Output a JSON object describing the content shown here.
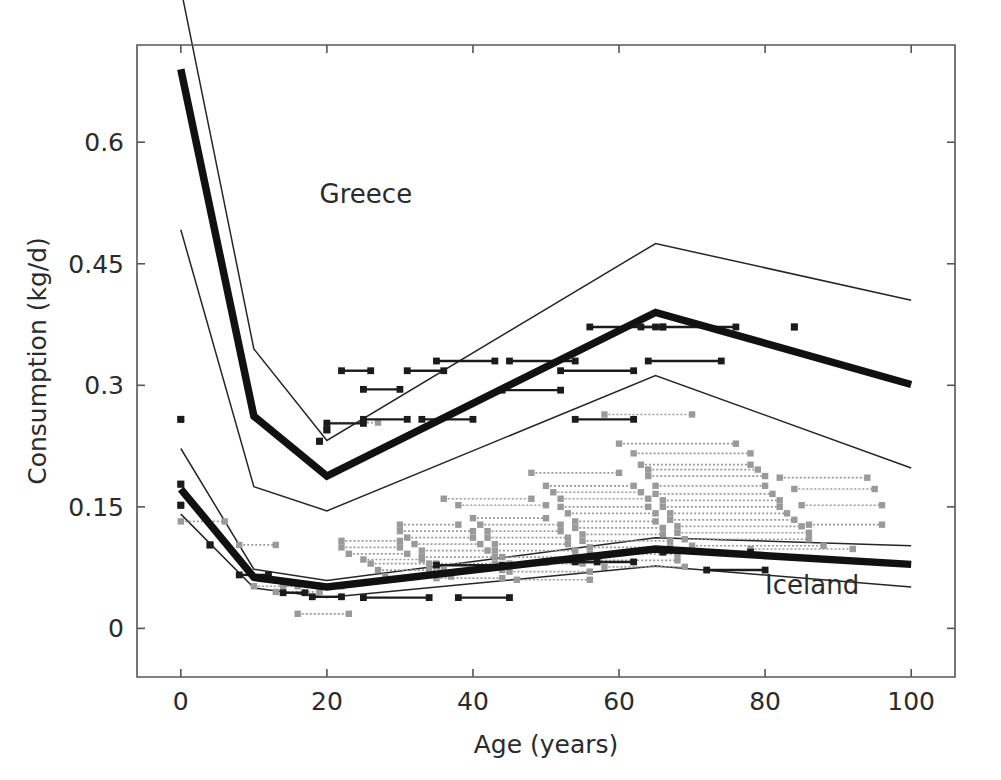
{
  "chart_data": {
    "type": "line",
    "title": "",
    "xlabel": "Age (years)",
    "ylabel": "Consumption (kg/d)",
    "xlim": [
      -6,
      106
    ],
    "ylim": [
      -0.06,
      0.72
    ],
    "xticks": [
      0,
      20,
      40,
      60,
      80,
      100
    ],
    "xticklabels": [
      "0",
      "20",
      "40",
      "60",
      "80",
      "100"
    ],
    "yticks": [
      0,
      0.15,
      0.3,
      0.45,
      0.6
    ],
    "yticklabels": [
      "0",
      "0.15",
      "0.3",
      "0.45",
      "0.6"
    ],
    "grid": false,
    "legend_position": "in-plot annotations",
    "annotations": [
      {
        "text": "Greece",
        "x": 19,
        "y": 0.525
      },
      {
        "text": "Iceland",
        "x": 80,
        "y": 0.042
      }
    ],
    "x": [
      0,
      10,
      20,
      65,
      100
    ],
    "series": [
      {
        "name": "Greece upper band",
        "style": "thin-line",
        "color": "#262626",
        "x": [
          0,
          10,
          20,
          65,
          100
        ],
        "values": [
          0.79,
          0.345,
          0.232,
          0.475,
          0.405
        ]
      },
      {
        "name": "Greece median",
        "style": "thick-line",
        "color": "#111111",
        "x": [
          0,
          10,
          20,
          65,
          100
        ],
        "values": [
          0.69,
          0.262,
          0.188,
          0.39,
          0.301
        ]
      },
      {
        "name": "Greece lower band",
        "style": "thin-line",
        "color": "#262626",
        "x": [
          0,
          10,
          20,
          65,
          100
        ],
        "values": [
          0.492,
          0.175,
          0.145,
          0.312,
          0.198
        ]
      },
      {
        "name": "Iceland upper band",
        "style": "thin-line",
        "color": "#262626",
        "x": [
          0,
          10,
          20,
          65,
          100
        ],
        "values": [
          0.222,
          0.073,
          0.059,
          0.112,
          0.102
        ]
      },
      {
        "name": "Iceland median",
        "style": "thick-line",
        "color": "#111111",
        "x": [
          0,
          10,
          20,
          65,
          100
        ],
        "values": [
          0.172,
          0.063,
          0.051,
          0.098,
          0.079
        ]
      },
      {
        "name": "Iceland lower band",
        "style": "thin-line",
        "color": "#262626",
        "x": [
          0,
          10,
          20,
          65,
          100
        ],
        "values": [
          0.141,
          0.05,
          0.038,
          0.077,
          0.051
        ]
      }
    ],
    "observations_dark": [
      {
        "x0": 0,
        "x1": 0,
        "y": 0.258
      },
      {
        "x0": 0,
        "x1": 0,
        "y": 0.178
      },
      {
        "x0": 0,
        "x1": 0,
        "y": 0.152
      },
      {
        "x0": 4,
        "x1": 4,
        "y": 0.103
      },
      {
        "x0": 8,
        "x1": 12,
        "y": 0.066
      },
      {
        "x0": 14,
        "x1": 17,
        "y": 0.044
      },
      {
        "x0": 18,
        "x1": 22,
        "y": 0.039
      },
      {
        "x0": 19,
        "x1": 19,
        "y": 0.231
      },
      {
        "x0": 20,
        "x1": 25,
        "y": 0.253
      },
      {
        "x0": 20,
        "x1": 20,
        "y": 0.245
      },
      {
        "x0": 22,
        "x1": 26,
        "y": 0.318
      },
      {
        "x0": 25,
        "x1": 30,
        "y": 0.295
      },
      {
        "x0": 25,
        "x1": 31,
        "y": 0.258
      },
      {
        "x0": 25,
        "x1": 34,
        "y": 0.038
      },
      {
        "x0": 31,
        "x1": 36,
        "y": 0.318
      },
      {
        "x0": 33,
        "x1": 40,
        "y": 0.258
      },
      {
        "x0": 35,
        "x1": 43,
        "y": 0.33
      },
      {
        "x0": 35,
        "x1": 44,
        "y": 0.078
      },
      {
        "x0": 38,
        "x1": 45,
        "y": 0.038
      },
      {
        "x0": 44,
        "x1": 52,
        "y": 0.294
      },
      {
        "x0": 45,
        "x1": 54,
        "y": 0.33
      },
      {
        "x0": 50,
        "x1": 57,
        "y": 0.082
      },
      {
        "x0": 52,
        "x1": 62,
        "y": 0.318
      },
      {
        "x0": 54,
        "x1": 62,
        "y": 0.258
      },
      {
        "x0": 54,
        "x1": 62,
        "y": 0.082
      },
      {
        "x0": 56,
        "x1": 66,
        "y": 0.372
      },
      {
        "x0": 63,
        "x1": 66,
        "y": 0.372
      },
      {
        "x0": 64,
        "x1": 74,
        "y": 0.33
      },
      {
        "x0": 65,
        "x1": 76,
        "y": 0.372
      },
      {
        "x0": 66,
        "x1": 78,
        "y": 0.094
      },
      {
        "x0": 74,
        "x1": 74,
        "y": 0.368
      },
      {
        "x0": 72,
        "x1": 80,
        "y": 0.072
      },
      {
        "x0": 84,
        "x1": 84,
        "y": 0.372
      }
    ],
    "observations_gray": [
      {
        "x0": 0,
        "x1": 6,
        "y": 0.132
      },
      {
        "x0": 8,
        "x1": 13,
        "y": 0.103
      },
      {
        "x0": 10,
        "x1": 16,
        "y": 0.052
      },
      {
        "x0": 13,
        "x1": 19,
        "y": 0.045
      },
      {
        "x0": 14,
        "x1": 22,
        "y": 0.052
      },
      {
        "x0": 16,
        "x1": 23,
        "y": 0.018
      },
      {
        "x0": 20,
        "x1": 27,
        "y": 0.254
      },
      {
        "x0": 22,
        "x1": 30,
        "y": 0.108
      },
      {
        "x0": 22,
        "x1": 30,
        "y": 0.1
      },
      {
        "x0": 23,
        "x1": 31,
        "y": 0.092
      },
      {
        "x0": 25,
        "x1": 33,
        "y": 0.085
      },
      {
        "x0": 26,
        "x1": 35,
        "y": 0.08
      },
      {
        "x0": 27,
        "x1": 36,
        "y": 0.072
      },
      {
        "x0": 28,
        "x1": 37,
        "y": 0.064
      },
      {
        "x0": 30,
        "x1": 38,
        "y": 0.128
      },
      {
        "x0": 30,
        "x1": 40,
        "y": 0.12
      },
      {
        "x0": 31,
        "x1": 40,
        "y": 0.112
      },
      {
        "x0": 32,
        "x1": 41,
        "y": 0.104
      },
      {
        "x0": 33,
        "x1": 42,
        "y": 0.096
      },
      {
        "x0": 33,
        "x1": 43,
        "y": 0.088
      },
      {
        "x0": 34,
        "x1": 43,
        "y": 0.08
      },
      {
        "x0": 34,
        "x1": 44,
        "y": 0.072
      },
      {
        "x0": 35,
        "x1": 44,
        "y": 0.062
      },
      {
        "x0": 36,
        "x1": 48,
        "y": 0.16
      },
      {
        "x0": 38,
        "x1": 50,
        "y": 0.152
      },
      {
        "x0": 40,
        "x1": 50,
        "y": 0.136
      },
      {
        "x0": 41,
        "x1": 52,
        "y": 0.128
      },
      {
        "x0": 42,
        "x1": 52,
        "y": 0.12
      },
      {
        "x0": 42,
        "x1": 53,
        "y": 0.112
      },
      {
        "x0": 43,
        "x1": 53,
        "y": 0.104
      },
      {
        "x0": 43,
        "x1": 54,
        "y": 0.096
      },
      {
        "x0": 44,
        "x1": 54,
        "y": 0.088
      },
      {
        "x0": 45,
        "x1": 55,
        "y": 0.08
      },
      {
        "x0": 45,
        "x1": 56,
        "y": 0.07
      },
      {
        "x0": 46,
        "x1": 56,
        "y": 0.06
      },
      {
        "x0": 48,
        "x1": 60,
        "y": 0.192
      },
      {
        "x0": 50,
        "x1": 62,
        "y": 0.176
      },
      {
        "x0": 51,
        "x1": 63,
        "y": 0.168
      },
      {
        "x0": 52,
        "x1": 64,
        "y": 0.16
      },
      {
        "x0": 52,
        "x1": 64,
        "y": 0.15
      },
      {
        "x0": 53,
        "x1": 65,
        "y": 0.142
      },
      {
        "x0": 54,
        "x1": 65,
        "y": 0.132
      },
      {
        "x0": 54,
        "x1": 66,
        "y": 0.124
      },
      {
        "x0": 55,
        "x1": 66,
        "y": 0.116
      },
      {
        "x0": 55,
        "x1": 67,
        "y": 0.108
      },
      {
        "x0": 56,
        "x1": 67,
        "y": 0.1
      },
      {
        "x0": 56,
        "x1": 68,
        "y": 0.092
      },
      {
        "x0": 57,
        "x1": 68,
        "y": 0.084
      },
      {
        "x0": 58,
        "x1": 69,
        "y": 0.076
      },
      {
        "x0": 58,
        "x1": 70,
        "y": 0.264
      },
      {
        "x0": 60,
        "x1": 76,
        "y": 0.228
      },
      {
        "x0": 62,
        "x1": 78,
        "y": 0.216
      },
      {
        "x0": 63,
        "x1": 78,
        "y": 0.202
      },
      {
        "x0": 64,
        "x1": 79,
        "y": 0.196
      },
      {
        "x0": 64,
        "x1": 80,
        "y": 0.188
      },
      {
        "x0": 65,
        "x1": 80,
        "y": 0.176
      },
      {
        "x0": 65,
        "x1": 81,
        "y": 0.166
      },
      {
        "x0": 66,
        "x1": 82,
        "y": 0.158
      },
      {
        "x0": 66,
        "x1": 82,
        "y": 0.15
      },
      {
        "x0": 67,
        "x1": 83,
        "y": 0.142
      },
      {
        "x0": 67,
        "x1": 84,
        "y": 0.134
      },
      {
        "x0": 68,
        "x1": 85,
        "y": 0.126
      },
      {
        "x0": 68,
        "x1": 86,
        "y": 0.118
      },
      {
        "x0": 69,
        "x1": 86,
        "y": 0.11
      },
      {
        "x0": 70,
        "x1": 88,
        "y": 0.102
      },
      {
        "x0": 82,
        "x1": 94,
        "y": 0.186
      },
      {
        "x0": 84,
        "x1": 95,
        "y": 0.172
      },
      {
        "x0": 85,
        "x1": 96,
        "y": 0.152
      },
      {
        "x0": 86,
        "x1": 96,
        "y": 0.128
      },
      {
        "x0": 78,
        "x1": 92,
        "y": 0.098
      }
    ]
  },
  "axes": {
    "xlabel": "Age (years)",
    "ylabel": "Consumption (kg/d)"
  }
}
